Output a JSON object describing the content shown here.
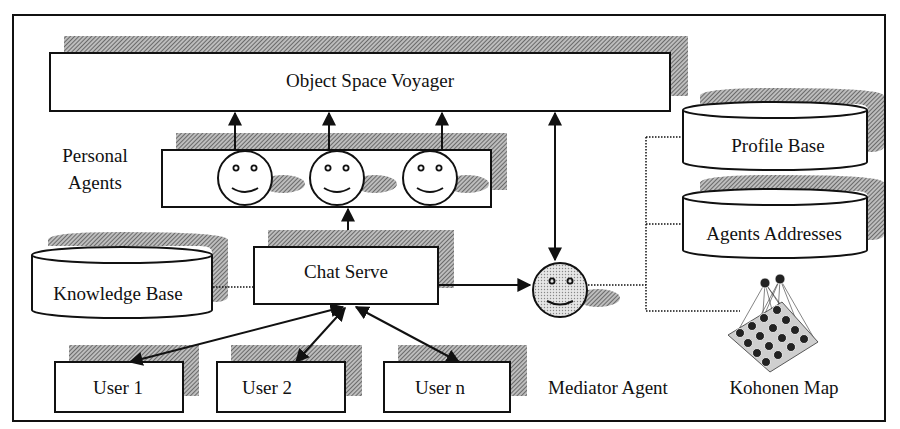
{
  "diagram": {
    "nodes": {
      "object_space_voyager": {
        "label": "Object Space Voyager"
      },
      "personal_agents": {
        "label_line1": "Personal",
        "label_line2": "Agents",
        "agent_count": 3
      },
      "chat_server": {
        "label": "Chat Serve"
      },
      "knowledge_base": {
        "label": "Knowledge Base"
      },
      "users": [
        {
          "label": "User 1"
        },
        {
          "label": "User 2"
        },
        {
          "label": "User n"
        }
      ],
      "mediator_agent": {
        "label": "Mediator Agent"
      },
      "profile_base": {
        "label": "Profile Base"
      },
      "agents_addresses": {
        "label": "Agents Addresses"
      },
      "kohonen_map": {
        "label": "Kohonen Map"
      }
    },
    "edges": [
      {
        "from": "personal_agents.agent_1",
        "to": "object_space_voyager",
        "style": "arrow"
      },
      {
        "from": "personal_agents.agent_2",
        "to": "object_space_voyager",
        "style": "arrow"
      },
      {
        "from": "personal_agents.agent_3",
        "to": "object_space_voyager",
        "style": "arrow"
      },
      {
        "from": "personal_agents",
        "to": "chat_server",
        "style": "double-arrow"
      },
      {
        "from": "object_space_voyager",
        "to": "mediator_agent",
        "style": "double-arrow"
      },
      {
        "from": "chat_server",
        "to": "mediator_agent",
        "style": "arrow"
      },
      {
        "from": "knowledge_base",
        "to": "chat_server",
        "style": "dotted"
      },
      {
        "from": "chat_server",
        "to": "users.0",
        "style": "double-arrow"
      },
      {
        "from": "chat_server",
        "to": "users.1",
        "style": "double-arrow"
      },
      {
        "from": "chat_server",
        "to": "users.2",
        "style": "double-arrow"
      },
      {
        "from": "mediator_agent",
        "to": "profile_base",
        "style": "dotted"
      },
      {
        "from": "mediator_agent",
        "to": "agents_addresses",
        "style": "dotted"
      },
      {
        "from": "mediator_agent",
        "to": "kohonen_map",
        "style": "dotted"
      }
    ],
    "colors": {
      "stroke": "#111111",
      "shadow": "#8a8a8a",
      "mediator_fill": "#d4d4d4",
      "background": "#ffffff"
    }
  }
}
